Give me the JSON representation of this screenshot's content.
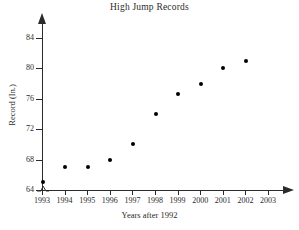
{
  "chart_data": {
    "type": "scatter",
    "title": "High Jump Records",
    "xlabel": "Years after 1992",
    "ylabel": "Record (In.)",
    "x": [
      1993,
      1994,
      1995,
      1996,
      1997,
      1998,
      1999,
      2000,
      2001,
      2002
    ],
    "values": [
      65,
      67,
      67,
      68,
      70,
      74,
      76.7,
      78,
      80.1,
      81
    ],
    "categories": [
      "1993",
      "1994",
      "1995",
      "1996",
      "1997",
      "1998",
      "1999",
      "2000",
      "2001",
      "2002"
    ],
    "xtick_labels": [
      "1993",
      "1994",
      "1995",
      "1996",
      "1997",
      "1998",
      "1999",
      "2000",
      "2001",
      "2002",
      "2003"
    ],
    "ytick_labels": [
      "64",
      "68",
      "72",
      "76",
      "80",
      "84"
    ],
    "ytick_values": [
      64,
      68,
      72,
      76,
      80,
      84
    ],
    "xlim": [
      1993,
      2003
    ],
    "ylim": [
      64,
      85
    ],
    "grid": false,
    "legend": false,
    "axis_break_y": true,
    "marker_color": "#000000",
    "axis_color": "#2b2b2b",
    "background_color": "#ffffff"
  }
}
